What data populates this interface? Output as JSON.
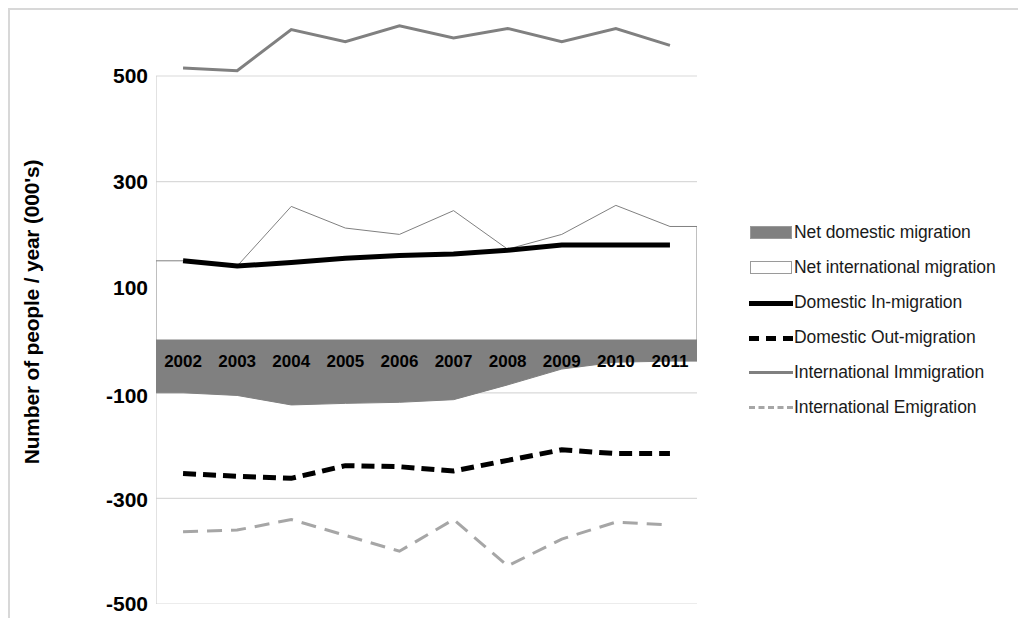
{
  "axis": {
    "y_title": "Number of people / year (000's)",
    "y_ticks": [
      "500",
      "300",
      "100",
      "-100",
      "-300",
      "-500"
    ],
    "x_ticks": [
      "2002",
      "2003",
      "2004",
      "2005",
      "2006",
      "2007",
      "2008",
      "2009",
      "2010",
      "2011"
    ]
  },
  "legend": {
    "items": [
      {
        "label": "Net domestic migration",
        "marker": "filled-swatch",
        "color": "#808080"
      },
      {
        "label": "Net international migration",
        "marker": "outline-swatch",
        "color": "#ffffff"
      },
      {
        "label": "Domestic In-migration",
        "marker": "solid-line",
        "color": "#000000"
      },
      {
        "label": "Domestic Out-migration",
        "marker": "dashed-line",
        "color": "#000000"
      },
      {
        "label": "International Immigration",
        "marker": "solid-line",
        "color": "#808080"
      },
      {
        "label": "International Emigration",
        "marker": "dashed-line",
        "color": "#a6a6a6"
      }
    ]
  },
  "chart_data": {
    "type": "area",
    "title": "",
    "xlabel": "",
    "ylabel": "Number of people / year (000's)",
    "ylim": [
      -500,
      500
    ],
    "ytick_values": [
      500,
      300,
      100,
      -100,
      -300,
      -500
    ],
    "grid": true,
    "legend_position": "right",
    "categories": [
      "2002",
      "2003",
      "2004",
      "2005",
      "2006",
      "2007",
      "2008",
      "2009",
      "2010",
      "2011"
    ],
    "series": [
      {
        "name": "Net domestic migration",
        "kind": "area",
        "color": "#808080",
        "values": [
          -100,
          -105,
          -123,
          -120,
          -118,
          -113,
          -85,
          -55,
          -42,
          -40
        ]
      },
      {
        "name": "Net international migration",
        "kind": "area",
        "color": "#ffffff",
        "values": [
          150,
          140,
          253,
          212,
          200,
          245,
          172,
          200,
          255,
          215
        ]
      },
      {
        "name": "Domestic In-migration",
        "kind": "line",
        "color": "#000000",
        "values": [
          150,
          140,
          147,
          155,
          160,
          163,
          170,
          180,
          180,
          180
        ]
      },
      {
        "name": "Domestic Out-migration",
        "kind": "dashed-line",
        "color": "#000000",
        "values": [
          -253,
          -258,
          -262,
          -238,
          -240,
          -248,
          -228,
          -208,
          -215,
          -215
        ]
      },
      {
        "name": "International Immigration",
        "kind": "line",
        "color": "#808080",
        "values": [
          515,
          510,
          588,
          565,
          595,
          572,
          590,
          565,
          590,
          558
        ]
      },
      {
        "name": "International Emigration",
        "kind": "dashed-line",
        "color": "#a6a6a6",
        "values": [
          -363,
          -360,
          -340,
          -370,
          -400,
          -340,
          -428,
          -377,
          -345,
          -350
        ]
      }
    ]
  }
}
